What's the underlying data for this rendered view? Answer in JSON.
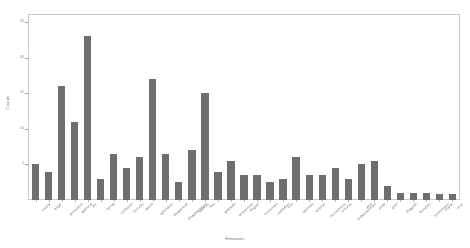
{
  "chart_data": {
    "type": "bar",
    "title": "",
    "xlabel": "Emotions",
    "ylabel": "Counts",
    "ylim": [
      0,
      26
    ],
    "yticks": [
      5,
      10,
      15,
      20,
      25
    ],
    "ytick_labels": [
      "5",
      "10",
      "15",
      "20",
      "25"
    ],
    "grid": false,
    "legend": null,
    "bar_color": "#6e6e6e",
    "categories": [
      "neutral",
      "anger",
      "annoyance",
      "approval",
      "joy",
      "caring",
      "confusion",
      "curiosity",
      "desire",
      "admiration",
      "disapproval",
      "disappointment",
      "sadness",
      "fear",
      "gratitude",
      "amusement",
      "disgust",
      "excitement",
      "realization",
      "love",
      "optimism",
      "surprise",
      "nervousness",
      "remorse",
      "embarrassment",
      "relief",
      "pride",
      "grief",
      "disgust2",
      "boredom",
      "contentment",
      "shame",
      "envy"
    ],
    "values": [
      5.0,
      4.0,
      16.0,
      11.0,
      23.0,
      3.0,
      6.5,
      4.5,
      6.0,
      17.0,
      6.5,
      2.5,
      7.0,
      15.0,
      4.0,
      5.5,
      3.5,
      3.5,
      2.5,
      3.0,
      6.0,
      3.5,
      3.5,
      4.5,
      3.0,
      5.0,
      5.5,
      2.0,
      1.0,
      1.0,
      1.0,
      0.9,
      0.9
    ]
  }
}
